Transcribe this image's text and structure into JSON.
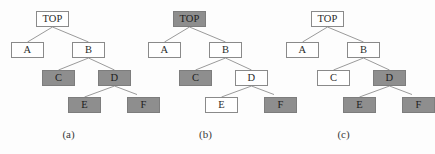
{
  "figure": {
    "width": 412,
    "height": 154,
    "background_color": "#fdfdfd",
    "node_fill_white": "#ffffff",
    "node_fill_gray": "#8e8e8e",
    "node_border_color": "#8a8a8a",
    "edge_color": "#8f8f8f",
    "text_color": "#2b2b2b"
  },
  "node_labels": {
    "top": "TOP",
    "a": "A",
    "b": "B",
    "c": "C",
    "d": "D",
    "e": "E",
    "f": "F"
  },
  "trees": [
    {
      "caption": "(a)",
      "nodes": {
        "top": {
          "label": "TOP",
          "fill": "white"
        },
        "a": {
          "label": "A",
          "fill": "white"
        },
        "b": {
          "label": "B",
          "fill": "white"
        },
        "c": {
          "label": "C",
          "fill": "gray"
        },
        "d": {
          "label": "D",
          "fill": "gray"
        },
        "e": {
          "label": "E",
          "fill": "gray"
        },
        "f": {
          "label": "F",
          "fill": "gray"
        }
      }
    },
    {
      "caption": "(b)",
      "nodes": {
        "top": {
          "label": "TOP",
          "fill": "gray"
        },
        "a": {
          "label": "A",
          "fill": "white"
        },
        "b": {
          "label": "B",
          "fill": "white"
        },
        "c": {
          "label": "C",
          "fill": "gray"
        },
        "d": {
          "label": "D",
          "fill": "white"
        },
        "e": {
          "label": "E",
          "fill": "white"
        },
        "f": {
          "label": "F",
          "fill": "gray"
        }
      }
    },
    {
      "caption": "(c)",
      "nodes": {
        "top": {
          "label": "TOP",
          "fill": "white"
        },
        "a": {
          "label": "A",
          "fill": "white"
        },
        "b": {
          "label": "B",
          "fill": "white"
        },
        "c": {
          "label": "C",
          "fill": "white"
        },
        "d": {
          "label": "D",
          "fill": "gray"
        },
        "e": {
          "label": "E",
          "fill": "gray"
        },
        "f": {
          "label": "F",
          "fill": "gray"
        }
      }
    }
  ],
  "edges": [
    {
      "from": "top",
      "to": "a"
    },
    {
      "from": "top",
      "to": "b"
    },
    {
      "from": "b",
      "to": "c"
    },
    {
      "from": "b",
      "to": "d"
    },
    {
      "from": "d",
      "to": "e"
    },
    {
      "from": "d",
      "to": "f"
    }
  ]
}
